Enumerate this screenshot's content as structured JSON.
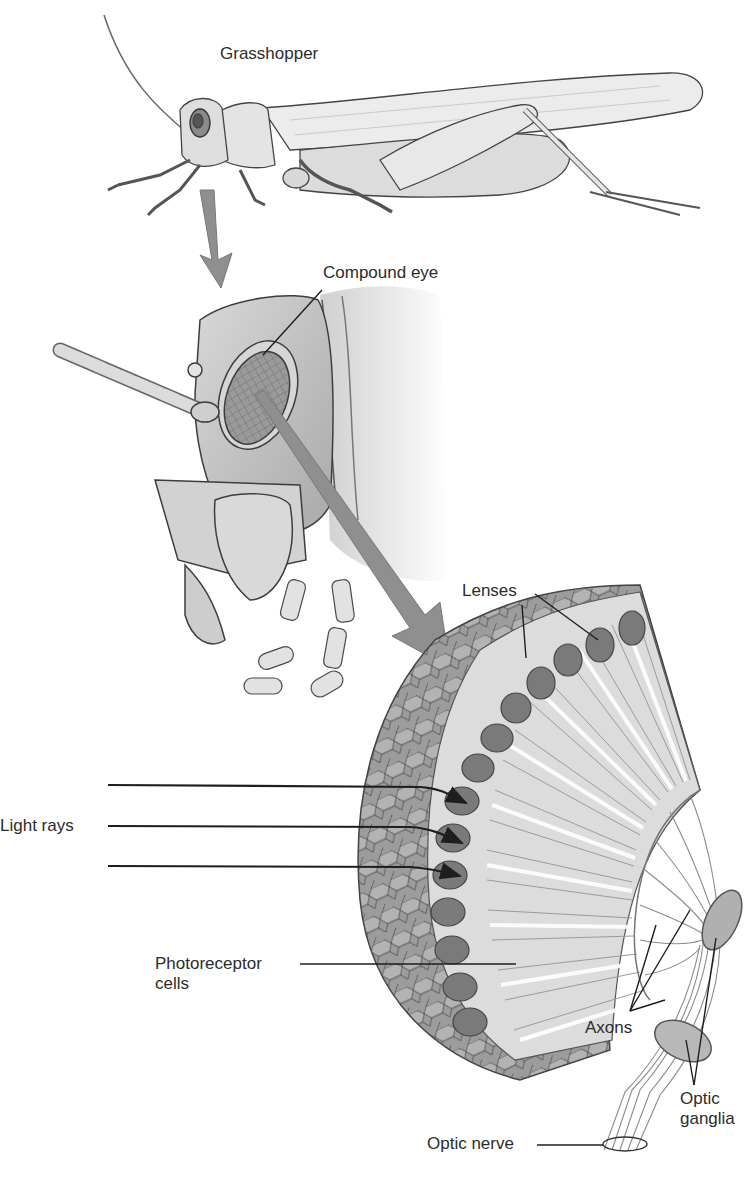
{
  "figure": {
    "subjects": {
      "grasshopper": "Grasshopper",
      "compound_eye": "Compound eye"
    },
    "labels": {
      "lenses": "Lenses",
      "light_rays": "Light rays",
      "photoreceptor_line1": "Photoreceptor",
      "photoreceptor_line2": "cells",
      "axons": "Axons",
      "optic_ganglia_line1": "Optic",
      "optic_ganglia_line2": "ganglia",
      "optic_nerve": "Optic nerve"
    },
    "colors": {
      "ink": "#2a2a2a",
      "body_fill": "#e3e3e3",
      "shade": "#b8b8b8",
      "pointer_arrow": "#8f8f8f",
      "lens_cell": "#7a7a7a",
      "background": "#ffffff"
    }
  }
}
